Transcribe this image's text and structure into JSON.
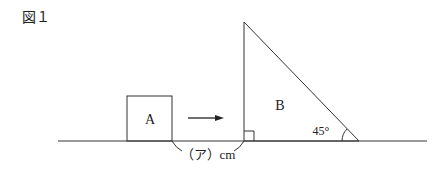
{
  "figure_label": "図１",
  "shape_a_label": "A",
  "shape_b_label": "B",
  "angle_label": "45°",
  "gap_label": "（ア）cm",
  "colors": {
    "stroke": "#333333",
    "text": "#222222"
  }
}
